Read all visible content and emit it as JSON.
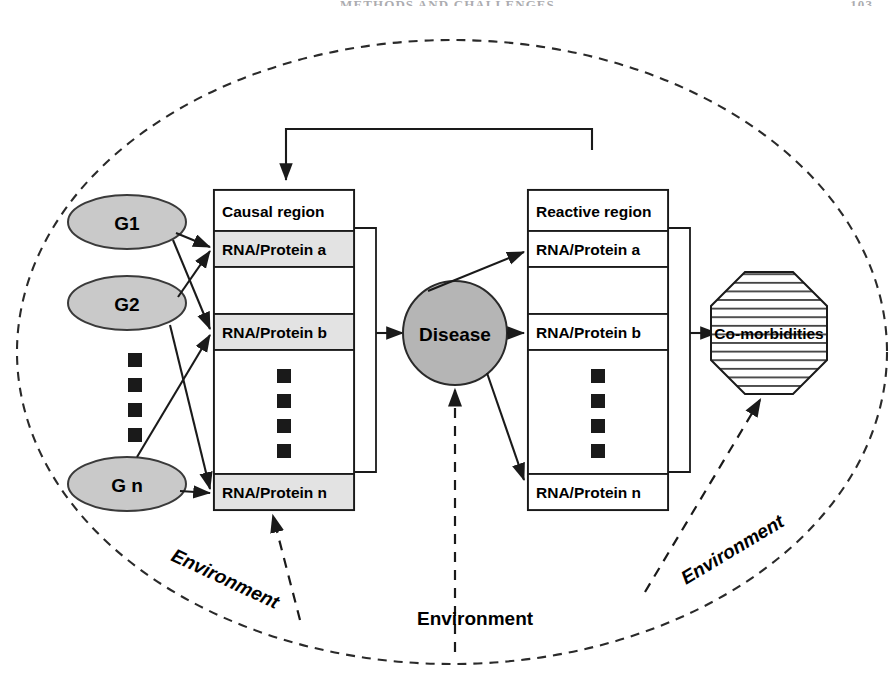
{
  "header": {
    "running_title": "METHODS AND CHALLENGES",
    "page_number": "103"
  },
  "figure": {
    "boundary_label": "dashed-ellipse-boundary",
    "genes": [
      {
        "id": "g1",
        "label": "G1"
      },
      {
        "id": "g2",
        "label": "G2"
      },
      {
        "id": "gn",
        "label": "G n"
      }
    ],
    "gene_ellipsis": "vertical-square-dots",
    "causal_region": {
      "title": "Causal region",
      "rows": [
        {
          "id": "causal-a",
          "label": "RNA/Protein a"
        },
        {
          "id": "causal-b",
          "label": "RNA/Protein b"
        },
        {
          "id": "causal-n",
          "label": "RNA/Protein n"
        }
      ],
      "ellipsis": "vertical-square-dots"
    },
    "disease": {
      "label": "Disease"
    },
    "reactive_region": {
      "title": "Reactive region",
      "rows": [
        {
          "id": "reactive-a",
          "label": "RNA/Protein a"
        },
        {
          "id": "reactive-b",
          "label": "RNA/Protein b"
        },
        {
          "id": "reactive-n",
          "label": "RNA/Protein n"
        }
      ],
      "ellipsis": "vertical-square-dots"
    },
    "comorbidities": {
      "label": "Co-morbidities"
    },
    "environment_labels": [
      {
        "id": "env-left",
        "label": "Environment"
      },
      {
        "id": "env-bottom",
        "label": "Environment"
      },
      {
        "id": "env-right",
        "label": "Environment"
      }
    ],
    "colors": {
      "gene_fill": "#c9c9c9",
      "row_fill": "#e3e3e3",
      "disease_fill": "#b5b5b5",
      "stroke": "#1a1a1a",
      "white": "#ffffff"
    }
  }
}
